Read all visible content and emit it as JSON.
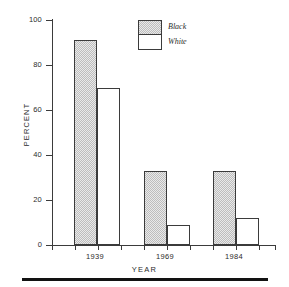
{
  "chart_data": {
    "type": "bar",
    "title": "",
    "xlabel": "YEAR",
    "ylabel": "PERCENT",
    "categories": [
      "1939",
      "1969",
      "1984"
    ],
    "series": [
      {
        "name": "Black",
        "values": [
          91,
          33,
          33
        ],
        "fill": "hatched-gray",
        "color": "#e9e9e9"
      },
      {
        "name": "White",
        "values": [
          70,
          9,
          12
        ],
        "fill": "solid-white",
        "color": "#ffffff"
      }
    ],
    "ylim": [
      0,
      100
    ],
    "yticks": [
      0,
      20,
      40,
      60,
      80,
      100
    ],
    "ytick_labels": [
      "0",
      "20",
      "40",
      "60",
      "80",
      "100"
    ],
    "grid": false,
    "legend_position": "top-center",
    "legend_entries": [
      "Black",
      "White"
    ],
    "axis_color": "#3b3b3b",
    "bar_edge_color": "#3b3b3b"
  },
  "axes": {
    "y_title": "PERCENT",
    "x_title": "YEAR",
    "yticks": [
      {
        "label": "100",
        "value": 100
      },
      {
        "label": "80",
        "value": 80
      },
      {
        "label": "60",
        "value": 60
      },
      {
        "label": "40",
        "value": 40
      },
      {
        "label": "20",
        "value": 20
      },
      {
        "label": "0",
        "value": 0
      }
    ],
    "xcats": [
      {
        "label": "1939"
      },
      {
        "label": "1969"
      },
      {
        "label": "1984"
      }
    ]
  },
  "legend": {
    "items": [
      {
        "label": "Black",
        "style": "hatched"
      },
      {
        "label": "White",
        "style": "plain"
      }
    ]
  }
}
